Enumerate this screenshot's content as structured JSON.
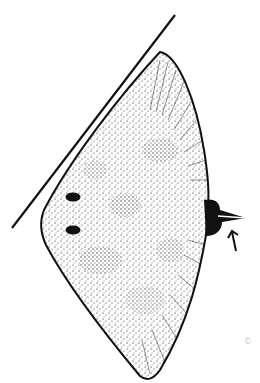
{
  "image": {
    "subject": "Stippled line illustration of a ray (dorsal view)",
    "style": "black ink stipple on white",
    "colors": {
      "ink": "#111111",
      "background": "#ffffff",
      "faint_mark": "#c8c8c8"
    }
  },
  "elements": {
    "tangent_line": "straight line along left anterior edge",
    "body": "rhomboid disc with dense stippling and radial fin striations",
    "spiracles": 2,
    "tail_stub": "short truncated tail at right",
    "arrow": "small arrow pointing to tail base",
    "corner_mark": "©"
  }
}
